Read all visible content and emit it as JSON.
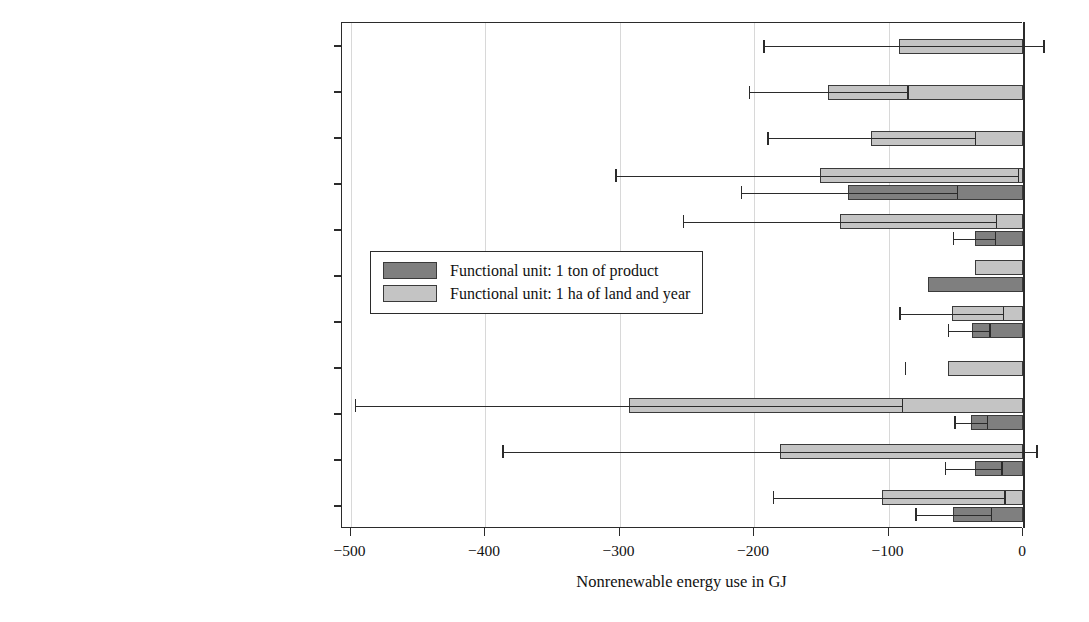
{
  "chart_data": {
    "type": "bar",
    "orientation": "horizontal",
    "title": "",
    "xlabel": "Nonrenewable energy use in GJ",
    "ylabel": "",
    "xlim": [
      -520,
      40
    ],
    "xticks": [
      -500,
      -400,
      -300,
      -200,
      -100,
      0
    ],
    "xticklabels": [
      "−500",
      "−400",
      "−300",
      "−200",
      "−100",
      "0"
    ],
    "grid": "vertical",
    "legend_position": "center-left-inside",
    "series": [
      {
        "name": "Functional unit: 1 ton of product",
        "color": "#7f7f7f",
        "key": "ton"
      },
      {
        "name": "Functional unit: 1 ha of land and year",
        "color": "#c4c4c4",
        "key": "ha"
      }
    ],
    "categories": [
      "Biofuels (0, 19)",
      "Bioenergy (0, 22)",
      "Floorboarding (0, 6)",
      "Lacquer and paints (2, 2)",
      "Composites (8, 10)",
      "Rubber (1, 1)",
      "Hydraulic oils and lubricants (6, 10)",
      "Insulation materials (0, 2)",
      "Surfactants (9, 11)",
      "Plastics (14, 16)",
      "Textiles (15, 15)"
    ],
    "points": [
      {
        "category": "Biofuels (0, 19)",
        "ton": null,
        "ton_low": null,
        "ton_high": null,
        "ha": -92,
        "ha_low": -193,
        "ha_high": 15
      },
      {
        "category": "Bioenergy (0, 22)",
        "ton": null,
        "ton_low": null,
        "ton_high": null,
        "ha": -145,
        "ha_low": -204,
        "ha_high": -86
      },
      {
        "category": "Floorboarding (0, 6)",
        "ton": null,
        "ton_low": null,
        "ton_high": null,
        "ha": -113,
        "ha_low": -190,
        "ha_high": -36
      },
      {
        "category": "Lacquer and paints (2, 2)",
        "ton": -130,
        "ton_low": -210,
        "ton_high": -49,
        "ha": -151,
        "ha_low": -303,
        "ha_high": -4
      },
      {
        "category": "Composites (8, 10)",
        "ton": -36,
        "ton_low": -52,
        "ton_high": -21,
        "ha": -136,
        "ha_low": -253,
        "ha_high": -20
      },
      {
        "category": "Rubber (1, 1)",
        "ton": -71,
        "ton_low": null,
        "ton_high": null,
        "ha": -36,
        "ha_low": null,
        "ha_high": null
      },
      {
        "category": "Hydraulic oils and lubricants (6, 10)",
        "ton": -38,
        "ton_low": -56,
        "ton_high": -25,
        "ha": -53,
        "ha_low": -92,
        "ha_high": -15
      },
      {
        "category": "Insulation materials (0, 2)",
        "ton": null,
        "ton_low": null,
        "ton_high": null,
        "ha": -56,
        "ha_low": -88,
        "ha_high": -88
      },
      {
        "category": "Surfactants (9, 11)",
        "ton": -39,
        "ton_low": -51,
        "ton_high": -27,
        "ha": -293,
        "ha_low": -497,
        "ha_high": -90
      },
      {
        "category": "Plastics (14, 16)",
        "ton": -36,
        "ton_low": -58,
        "ton_high": -16,
        "ha": -181,
        "ha_low": -387,
        "ha_high": 10
      },
      {
        "category": "Textiles (15, 15)",
        "ton": -52,
        "ton_low": -80,
        "ton_high": -24,
        "ha": -105,
        "ha_low": -186,
        "ha_high": -14
      }
    ]
  },
  "legend": {
    "items": [
      {
        "label": "Functional unit: 1 ton of product",
        "key": "ton"
      },
      {
        "label": "Functional unit: 1 ha of land and year",
        "key": "ha"
      }
    ]
  },
  "axis": {
    "x_title": "Nonrenewable energy use in GJ"
  }
}
